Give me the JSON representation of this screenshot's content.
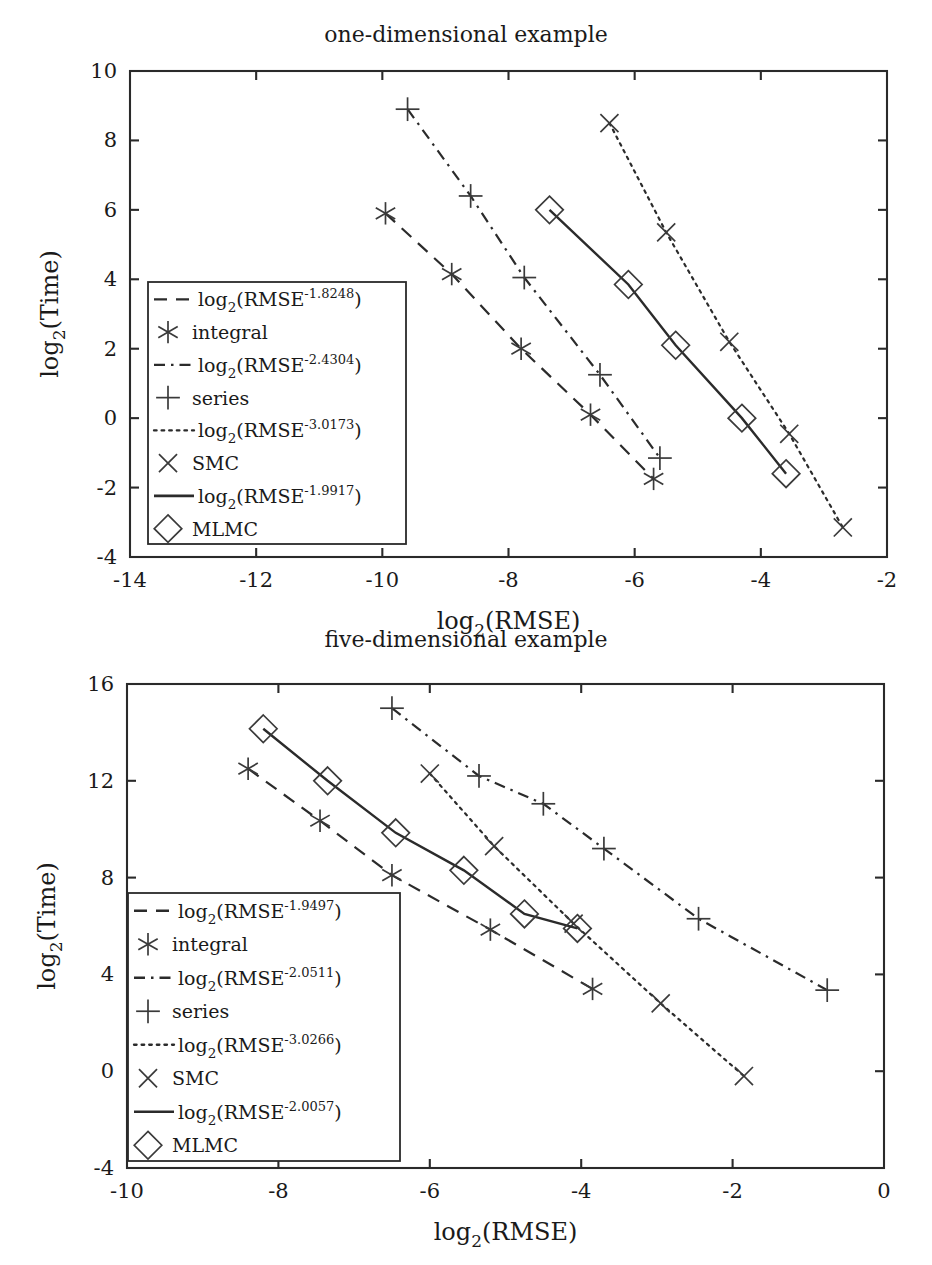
{
  "figure": {
    "panels": [
      {
        "id": "one-dimensional",
        "title": "one-dimensional example",
        "xlabel_main": "log",
        "xlabel_sub": "2",
        "xlabel_rest": "(RMSE)",
        "ylabel_main": "log",
        "ylabel_sub": "2",
        "ylabel_rest": "(Time)",
        "xticks": [
          "-14",
          "-12",
          "-10",
          "-8",
          "-6",
          "-4",
          "-2"
        ],
        "yticks": [
          "10",
          "8",
          "6",
          "4",
          "2",
          "0",
          "-2",
          "-4"
        ],
        "legend": [
          {
            "kind": "line",
            "style": "dashed",
            "base": "log",
            "sub": "2",
            "open": "(RMSE",
            "sup": "-1.8248",
            "close": ")"
          },
          {
            "kind": "marker",
            "style": "asterisk",
            "label": "integral"
          },
          {
            "kind": "line",
            "style": "dashdot",
            "base": "log",
            "sub": "2",
            "open": "(RMSE",
            "sup": "-2.4304",
            "close": ")"
          },
          {
            "kind": "marker",
            "style": "plus",
            "label": "series"
          },
          {
            "kind": "line",
            "style": "dotted",
            "base": "log",
            "sub": "2",
            "open": "(RMSE",
            "sup": "-3.0173",
            "close": ")"
          },
          {
            "kind": "marker",
            "style": "cross",
            "label": "SMC"
          },
          {
            "kind": "line",
            "style": "solid",
            "base": "log",
            "sub": "2",
            "open": "(RMSE",
            "sup": "-1.9917",
            "close": ")"
          },
          {
            "kind": "marker",
            "style": "diamond",
            "label": "MLMC"
          }
        ]
      },
      {
        "id": "five-dimensional",
        "title": "five-dimensional example",
        "xlabel_main": "log",
        "xlabel_sub": "2",
        "xlabel_rest": "(RMSE)",
        "ylabel_main": "log",
        "ylabel_sub": "2",
        "ylabel_rest": "(Time)",
        "xticks": [
          "-10",
          "-8",
          "-6",
          "-4",
          "-2",
          "0"
        ],
        "yticks": [
          "16",
          "12",
          "8",
          "4",
          "0",
          "-4"
        ],
        "legend": [
          {
            "kind": "line",
            "style": "dashed",
            "base": "log",
            "sub": "2",
            "open": "(RMSE",
            "sup": "-1.9497",
            "close": ")"
          },
          {
            "kind": "marker",
            "style": "asterisk",
            "label": "integral"
          },
          {
            "kind": "line",
            "style": "dashdot",
            "base": "log",
            "sub": "2",
            "open": "(RMSE",
            "sup": "-2.0511",
            "close": ")"
          },
          {
            "kind": "marker",
            "style": "plus",
            "label": "series"
          },
          {
            "kind": "line",
            "style": "dotted",
            "base": "log",
            "sub": "2",
            "open": "(RMSE",
            "sup": "-3.0266",
            "close": ")"
          },
          {
            "kind": "marker",
            "style": "cross",
            "label": "SMC"
          },
          {
            "kind": "line",
            "style": "solid",
            "base": "log",
            "sub": "2",
            "open": "(RMSE",
            "sup": "-2.0057",
            "close": ")"
          },
          {
            "kind": "marker",
            "style": "diamond",
            "label": "MLMC"
          }
        ]
      }
    ]
  },
  "chart_data": [
    {
      "type": "line",
      "title": "one-dimensional example",
      "xlabel": "log2(RMSE)",
      "ylabel": "log2(Time)",
      "xlim": [
        -14,
        -2
      ],
      "ylim": [
        -4,
        10
      ],
      "xticks": [
        -14,
        -12,
        -10,
        -8,
        -6,
        -4,
        -2
      ],
      "yticks": [
        -4,
        -2,
        0,
        2,
        4,
        6,
        8,
        10
      ],
      "grid": false,
      "legend_position": "left-center",
      "series": [
        {
          "name": "integral",
          "marker": "asterisk",
          "linestyle": "dashed",
          "fit_label": "log2(RMSE^-1.8248)",
          "slope": -1.8248,
          "x": [
            -9.95,
            -8.9,
            -7.8,
            -6.7,
            -5.7
          ],
          "y": [
            5.9,
            4.15,
            2.0,
            0.1,
            -1.75
          ]
        },
        {
          "name": "series",
          "marker": "plus",
          "linestyle": "dashdot",
          "fit_label": "log2(RMSE^-2.4304)",
          "slope": -2.4304,
          "x": [
            -9.6,
            -8.6,
            -7.75,
            -6.55,
            -5.6
          ],
          "y": [
            8.9,
            6.4,
            4.05,
            1.25,
            -1.15
          ]
        },
        {
          "name": "SMC",
          "marker": "cross",
          "linestyle": "dotted",
          "fit_label": "log2(RMSE^-3.0173)",
          "slope": -3.0173,
          "x": [
            -6.4,
            -5.5,
            -4.5,
            -3.55,
            -2.7
          ],
          "y": [
            8.5,
            5.35,
            2.2,
            -0.45,
            -3.15
          ]
        },
        {
          "name": "MLMC",
          "marker": "diamond",
          "linestyle": "solid",
          "fit_label": "log2(RMSE^-1.9917)",
          "slope": -1.9917,
          "x": [
            -7.35,
            -6.1,
            -5.35,
            -4.3,
            -3.6
          ],
          "y": [
            6.0,
            3.85,
            2.1,
            0.0,
            -1.6
          ]
        }
      ]
    },
    {
      "type": "line",
      "title": "five-dimensional example",
      "xlabel": "log2(RMSE)",
      "ylabel": "log2(Time)",
      "xlim": [
        -10,
        0
      ],
      "ylim": [
        -4,
        16
      ],
      "xticks": [
        -10,
        -8,
        -6,
        -4,
        -2,
        0
      ],
      "yticks": [
        -4,
        0,
        4,
        8,
        12,
        16
      ],
      "grid": false,
      "legend_position": "left-center",
      "series": [
        {
          "name": "integral",
          "marker": "asterisk",
          "linestyle": "dashed",
          "fit_label": "log2(RMSE^-1.9497)",
          "slope": -1.9497,
          "x": [
            -8.4,
            -7.45,
            -6.5,
            -5.2,
            -3.85
          ],
          "y": [
            12.5,
            10.35,
            8.1,
            5.85,
            3.4
          ]
        },
        {
          "name": "series",
          "marker": "plus",
          "linestyle": "dashdot",
          "fit_label": "log2(RMSE^-2.0511)",
          "slope": -2.0511,
          "x": [
            -6.5,
            -5.35,
            -4.5,
            -3.7,
            -2.45,
            -0.75
          ],
          "y": [
            15.0,
            12.2,
            11.05,
            9.2,
            6.3,
            3.35
          ]
        },
        {
          "name": "SMC",
          "marker": "cross",
          "linestyle": "dotted",
          "fit_label": "log2(RMSE^-3.0266)",
          "slope": -3.0266,
          "x": [
            -6.0,
            -5.15,
            -4.1,
            -2.95,
            -1.85
          ],
          "y": [
            12.3,
            9.3,
            6.1,
            2.8,
            -0.2
          ]
        },
        {
          "name": "MLMC",
          "marker": "diamond",
          "linestyle": "solid",
          "fit_label": "log2(RMSE^-2.0057)",
          "slope": -2.0057,
          "x": [
            -8.2,
            -7.35,
            -6.45,
            -5.55,
            -4.75,
            -4.05
          ],
          "y": [
            14.15,
            12.0,
            9.85,
            8.3,
            6.5,
            5.9
          ]
        }
      ]
    }
  ]
}
